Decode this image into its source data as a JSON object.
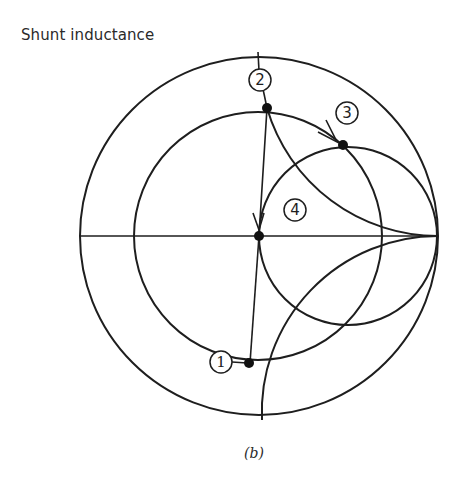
{
  "figure": {
    "title": "Shunt inductance",
    "caption": "(b)",
    "points": [
      {
        "id": "1",
        "label": "1"
      },
      {
        "id": "2",
        "label": "2"
      },
      {
        "id": "3",
        "label": "3"
      },
      {
        "id": "4",
        "label": "4"
      }
    ],
    "colors": {
      "ink": "#1e1e1e",
      "background": "#ffffff"
    }
  }
}
